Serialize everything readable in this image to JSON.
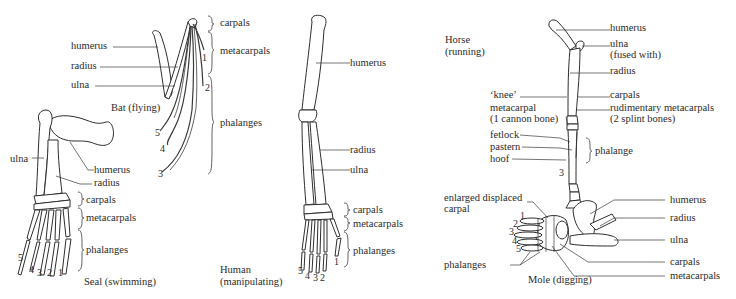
{
  "figure": {
    "bat": {
      "caption": "Bat (flying)",
      "labels": {
        "humerus": "humerus",
        "radius": "radius",
        "ulna": "ulna",
        "carpals": "carpals",
        "metacarpals": "metacarpals",
        "phalanges": "phalanges"
      },
      "digits": [
        "1",
        "2",
        "3",
        "4",
        "5"
      ]
    },
    "seal": {
      "caption": "Seal (swimming)",
      "labels": {
        "ulna": "ulna",
        "humerus": "humerus",
        "radius": "radius",
        "carpals": "carpals",
        "metacarpals": "metacarpals",
        "phalanges": "phalanges"
      },
      "digits": [
        "1",
        "2",
        "3",
        "4",
        "5"
      ]
    },
    "human": {
      "caption_line1": "Human",
      "caption_line2": "(manipulating)",
      "labels": {
        "humerus": "humerus",
        "radius": "radius",
        "ulna": "ulna",
        "carpals": "carpals",
        "metacarpals": "metacarpals",
        "phalanges": "phalanges"
      },
      "digits": [
        "1",
        "2",
        "3",
        "4",
        "5"
      ]
    },
    "horse": {
      "caption_line1": "Horse",
      "caption_line2": "(running)",
      "labels": {
        "humerus": "humerus",
        "ulna": "ulna",
        "ulna_note": "(fused with)",
        "radius": "radius",
        "knee": "‘knee’",
        "carpals": "carpals",
        "metacarpal": "metacarpal",
        "metacarpal_note": "(1 cannon bone)",
        "rudimentary": "rudimentary metacarpals",
        "rudimentary_note": "(2 splint bones)",
        "fetlock": "fetlock",
        "pastern": "pastern",
        "hoof": "hoof",
        "phalange": "phalange"
      },
      "digits": [
        "3"
      ]
    },
    "mole": {
      "caption": "Mole (digging)",
      "labels": {
        "enlarged_line1": "enlarged displaced",
        "enlarged_line2": "carpal",
        "humerus": "humerus",
        "radius": "radius",
        "ulna": "ulna",
        "carpals": "carpals",
        "metacarpals": "metacarpals",
        "phalanges": "phalanges"
      },
      "digits": [
        "1",
        "2",
        "3",
        "4",
        "5"
      ]
    }
  }
}
